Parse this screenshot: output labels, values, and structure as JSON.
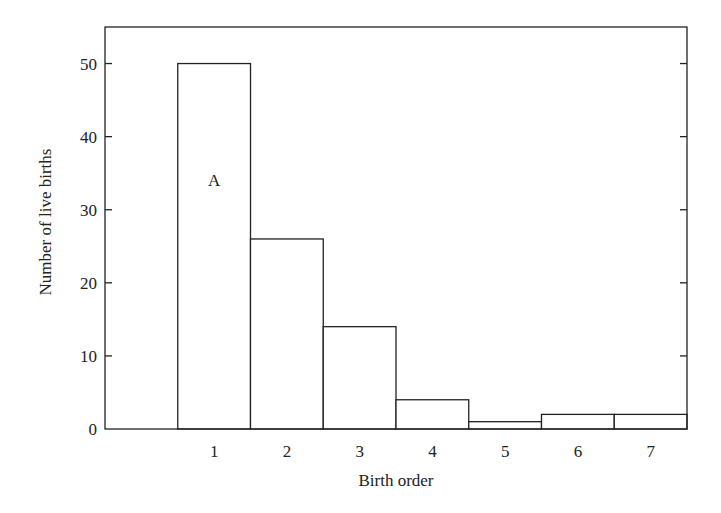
{
  "chart_data": {
    "type": "bar",
    "title": "",
    "xlabel": "Birth order",
    "ylabel": "Number of live births",
    "categories": [
      "1",
      "2",
      "3",
      "4",
      "5",
      "6",
      "7"
    ],
    "values": [
      50,
      26,
      14,
      4,
      1,
      2,
      2
    ],
    "ylim": [
      0,
      55
    ],
    "yticks": [
      0,
      10,
      20,
      30,
      40,
      50
    ],
    "grid": false,
    "legend": null,
    "annotations": [
      {
        "text": "A",
        "category": "1",
        "y": 34
      }
    ],
    "bar_style": {
      "fill": "#ffffff",
      "stroke": "#222222"
    }
  },
  "axes": {
    "x_label": "Birth order",
    "y_label": "Number of live births"
  }
}
